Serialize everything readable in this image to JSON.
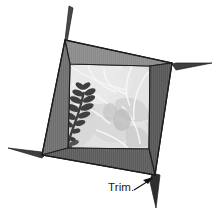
{
  "figure": {
    "type": "instructional-diagram",
    "background_color": "#ffffff"
  },
  "callout": {
    "label": "Trim.",
    "leader_color": "#111111",
    "arrow_target": "bottom-right-corner-spike"
  },
  "frame": {
    "name": "tilted-picture-frame",
    "rotation_note": "tilted counter-clockwise",
    "outer_corners": {
      "top_left": [
        65,
        40
      ],
      "top_right": [
        172,
        63
      ],
      "bottom_right": [
        155,
        175
      ],
      "bottom_left": [
        42,
        155
      ]
    },
    "inner_opening": {
      "top_left": [
        70,
        64
      ],
      "top_right": [
        150,
        66
      ],
      "bottom_right": [
        149,
        149
      ],
      "bottom_left": [
        68,
        148
      ]
    },
    "bars": [
      {
        "name": "top-bar",
        "color": "#8b8b8b"
      },
      {
        "name": "left-bar",
        "color": "#6f6f6f"
      },
      {
        "name": "right-bar",
        "color": "#575757"
      },
      {
        "name": "bottom-bar",
        "color": "#5c5c5c"
      }
    ],
    "outline_color": "#1c1c1c"
  },
  "photo": {
    "name": "foliage-photo",
    "description": "pale grayscale photograph of leaves and a dark fern frond",
    "base_color": "#dcdcdc",
    "highlight_color": "#efefef",
    "vein_color": "#f6f6f6",
    "shadow_color": "#b4b4b4",
    "fern_color": "#3f3f3f"
  },
  "spikes": [
    {
      "name": "top-spike",
      "color": "#4a4a4a",
      "position": "above top-left corner"
    },
    {
      "name": "right-spike",
      "color": "#3f3f3f",
      "position": "right of top-right corner"
    },
    {
      "name": "left-spike",
      "color": "#3f3f3f",
      "position": "left of bottom-left corner"
    },
    {
      "name": "bottom-right-spike",
      "color": "#2e2e2e",
      "position": "below bottom-right corner"
    }
  ]
}
